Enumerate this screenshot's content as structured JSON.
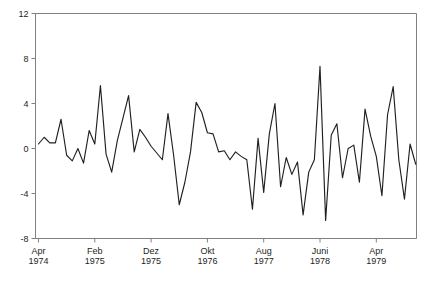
{
  "chart_data": {
    "type": "line",
    "title": "",
    "subtitle": "",
    "xlabel": "",
    "ylabel": "",
    "ylim": [
      -8,
      12
    ],
    "yticks": [
      -8,
      -4,
      0,
      4,
      8,
      12
    ],
    "ytick_labels": [
      "-8",
      "-4",
      "0",
      "4",
      "8",
      "12"
    ],
    "xtick_labels": [
      {
        "month": "Apr",
        "year": "1974"
      },
      {
        "month": "Feb",
        "year": "1975"
      },
      {
        "month": "Dez",
        "year": "1975"
      },
      {
        "month": "Okt",
        "year": "1976"
      },
      {
        "month": "Aug",
        "year": "1977"
      },
      {
        "month": "Juni",
        "year": "1978"
      },
      {
        "month": "Apr",
        "year": "1979"
      }
    ],
    "xtick_indices": [
      0,
      10,
      20,
      30,
      40,
      50,
      60
    ],
    "grid": false,
    "legend": false,
    "line_color": "#231f20",
    "axis_color": "#808080",
    "background": "#ffffff",
    "x": [
      0,
      1,
      2,
      3,
      4,
      5,
      6,
      7,
      8,
      9,
      10,
      11,
      12,
      13,
      14,
      15,
      16,
      17,
      18,
      19,
      20,
      21,
      22,
      23,
      24,
      25,
      26,
      27,
      28,
      29,
      30,
      31,
      32,
      33,
      34,
      35,
      36,
      37,
      38,
      39,
      40,
      41,
      42,
      43,
      44,
      45,
      46,
      47,
      48,
      49,
      50,
      51,
      52,
      53,
      54,
      55,
      56,
      57,
      58,
      59,
      60,
      61,
      62,
      63,
      64,
      65,
      66,
      67
    ],
    "values": [
      0.4,
      1.0,
      0.5,
      0.5,
      2.6,
      -0.6,
      -1.1,
      0.0,
      -1.3,
      1.6,
      0.4,
      5.6,
      -0.5,
      -2.1,
      0.7,
      2.7,
      4.7,
      -0.3,
      1.7,
      1.0,
      0.2,
      -0.4,
      -1.0,
      3.1,
      -0.6,
      -5.0,
      -3.0,
      -0.3,
      4.1,
      3.2,
      1.4,
      1.3,
      -0.3,
      -0.2,
      -1.0,
      -0.3,
      -0.7,
      -1.0,
      -5.4,
      0.9,
      -3.9,
      1.3,
      4.0,
      -3.4,
      -0.8,
      -2.3,
      -1.2,
      -5.9,
      -2.1,
      -1.0,
      7.3,
      -6.4,
      1.2,
      2.2,
      -2.6,
      0.0,
      0.3,
      -3.0,
      3.5,
      1.1,
      -0.7,
      -4.2,
      3.0,
      5.5,
      -1.0,
      -4.5,
      0.4,
      -1.4
    ]
  },
  "axes": {
    "y_axis_name": "y-axis",
    "x_axis_name": "x-axis"
  }
}
